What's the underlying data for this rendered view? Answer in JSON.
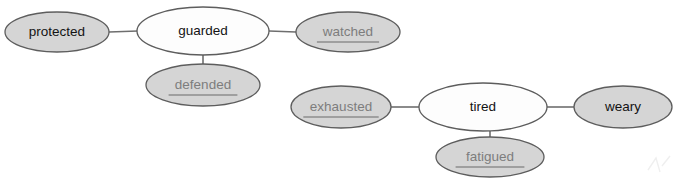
{
  "diagram": {
    "type": "node-link-graph",
    "background_color": "#ffffff",
    "edge_color": "#6e6e6e",
    "node_stroke_color": "#5d5d5d",
    "filled_node_color": "#d5d5d5",
    "hollow_node_color": "#fdfdfd",
    "dark_text_color": "#131313",
    "muted_text_color": "#7d7d7d",
    "clusters": [
      {
        "name": "guarded-cluster",
        "hub": "guarded",
        "members": [
          "protected",
          "guarded",
          "watched",
          "defended"
        ]
      },
      {
        "name": "tired-cluster",
        "hub": "tired",
        "members": [
          "exhausted",
          "tired",
          "weary",
          "fatigued"
        ]
      }
    ],
    "nodes": [
      {
        "id": "protected",
        "label": "protected",
        "cx": 57,
        "cy": 32,
        "rx": 52,
        "ry": 20,
        "fill": "filled",
        "text_style": "dark",
        "underlined": false,
        "cluster": "guarded-cluster"
      },
      {
        "id": "guarded",
        "label": "guarded",
        "cx": 203,
        "cy": 31,
        "rx": 66,
        "ry": 24,
        "fill": "hollow",
        "text_style": "dark",
        "underlined": false,
        "cluster": "guarded-cluster"
      },
      {
        "id": "watched",
        "label": "watched",
        "cx": 348,
        "cy": 32,
        "rx": 52,
        "ry": 20,
        "fill": "filled",
        "text_style": "muted",
        "underlined": true,
        "cluster": "guarded-cluster"
      },
      {
        "id": "defended",
        "label": "defended",
        "cx": 203,
        "cy": 85,
        "rx": 57,
        "ry": 21,
        "fill": "filled",
        "text_style": "muted",
        "underlined": true,
        "cluster": "guarded-cluster"
      },
      {
        "id": "exhausted",
        "label": "exhausted",
        "cx": 341,
        "cy": 107,
        "rx": 50,
        "ry": 21,
        "fill": "filled",
        "text_style": "muted",
        "underlined": true,
        "cluster": "tired-cluster"
      },
      {
        "id": "tired",
        "label": "tired",
        "cx": 483,
        "cy": 107,
        "rx": 64,
        "ry": 24,
        "fill": "hollow",
        "text_style": "dark",
        "underlined": false,
        "cluster": "tired-cluster"
      },
      {
        "id": "weary",
        "label": "weary",
        "cx": 623,
        "cy": 107,
        "rx": 49,
        "ry": 21,
        "fill": "filled",
        "text_style": "dark",
        "underlined": false,
        "cluster": "tired-cluster"
      },
      {
        "id": "fatigued",
        "label": "fatigued",
        "cx": 490,
        "cy": 157,
        "rx": 54,
        "ry": 20,
        "fill": "filled",
        "text_style": "muted",
        "underlined": true,
        "cluster": "tired-cluster"
      }
    ],
    "edges": [
      {
        "id": "protected-guarded",
        "from": "protected",
        "to": "guarded",
        "x1": 109,
        "y1": 32,
        "x2": 138,
        "y2": 31
      },
      {
        "id": "guarded-watched",
        "from": "guarded",
        "to": "watched",
        "x1": 269,
        "y1": 31,
        "x2": 296,
        "y2": 32
      },
      {
        "id": "guarded-defended",
        "from": "guarded",
        "to": "defended",
        "x1": 203,
        "y1": 55,
        "x2": 203,
        "y2": 65
      },
      {
        "id": "exhausted-tired",
        "from": "exhausted",
        "to": "tired",
        "x1": 391,
        "y1": 107,
        "x2": 419,
        "y2": 107
      },
      {
        "id": "tired-weary",
        "from": "tired",
        "to": "weary",
        "x1": 547,
        "y1": 107,
        "x2": 574,
        "y2": 107
      },
      {
        "id": "tired-fatigued",
        "from": "tired",
        "to": "fatigued",
        "x1": 490,
        "y1": 131,
        "x2": 490,
        "y2": 138
      }
    ]
  }
}
